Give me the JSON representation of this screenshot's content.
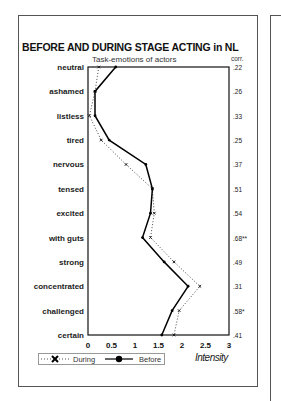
{
  "chart_data": {
    "type": "line",
    "title": "BEFORE AND DURING STAGE ACTING in NL",
    "subtitle": "Task-emotions of actors",
    "xlabel": "Intensity",
    "ylabel": "",
    "orientation": "horizontal-profile",
    "xlim": [
      0,
      3
    ],
    "xticks": [
      "0",
      "0.5",
      "1",
      "1.5",
      "2",
      "2.5",
      "3"
    ],
    "categories": [
      "neutral",
      "ashamed",
      "listless",
      "tired",
      "nervous",
      "tensed",
      "excited",
      "with guts",
      "strong",
      "concentrated",
      "challenged",
      "certain"
    ],
    "series": [
      {
        "name": "During",
        "marker": "x",
        "line": "dotted",
        "values": [
          0.23,
          0.15,
          0.03,
          0.28,
          0.81,
          1.37,
          1.41,
          1.33,
          1.83,
          2.38,
          1.94,
          1.83
        ]
      },
      {
        "name": "Before",
        "marker": "filled-circle",
        "line": "solid",
        "values": [
          0.59,
          0.15,
          0.15,
          0.45,
          1.23,
          1.37,
          1.33,
          1.16,
          1.62,
          2.13,
          1.79,
          1.57
        ]
      }
    ],
    "corr_header": "corr.",
    "corr": [
      ".22",
      ".26",
      ".33",
      ".25",
      ".37",
      ".51",
      ".54",
      ".68**",
      ".49",
      ".31",
      ".58*",
      ".41"
    ],
    "grid": false,
    "legend_position": "bottom-left"
  },
  "legend": {
    "during": "During",
    "before": "Before"
  }
}
